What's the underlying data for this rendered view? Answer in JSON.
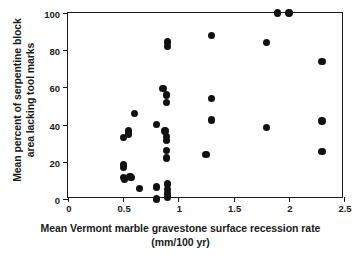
{
  "chart_data": {
    "type": "scatter",
    "title": "",
    "xlabel": "Mean Vermont marble gravestone surface recession rate (mm/100 yr)",
    "xlabel_line1": "Mean Vermont marble gravestone surface recession rate",
    "xlabel_line2": "(mm/100 yr)",
    "ylabel": "Mean percent of serpentine block area lacking tool marks",
    "ylabel_line1": "Mean percent of serpentine block",
    "ylabel_line2": "area lacking tool marks",
    "xlim": [
      0,
      2.5
    ],
    "ylim": [
      0,
      100
    ],
    "xticks": [
      0,
      0.5,
      1,
      1.5,
      2,
      2.5
    ],
    "xticklabels": [
      "0",
      "0.5",
      "1",
      "1.5",
      "2",
      "2.5"
    ],
    "yticks": [
      0,
      20,
      40,
      60,
      80,
      100
    ],
    "yticklabels": [
      "0",
      "20",
      "40",
      "60",
      "80",
      "100"
    ],
    "grid": false,
    "legend": null,
    "marker": "filled-circle",
    "marker_color": "#111111",
    "points": [
      {
        "x": 0.5,
        "y": 33.0
      },
      {
        "x": 0.5,
        "y": 18.5
      },
      {
        "x": 0.5,
        "y": 17.0
      },
      {
        "x": 0.5,
        "y": 11.5
      },
      {
        "x": 0.51,
        "y": 10.5
      },
      {
        "x": 0.55,
        "y": 36.5
      },
      {
        "x": 0.55,
        "y": 35.0
      },
      {
        "x": 0.56,
        "y": 12.0
      },
      {
        "x": 0.57,
        "y": 11.5
      },
      {
        "x": 0.6,
        "y": 46.0
      },
      {
        "x": 0.65,
        "y": 5.5
      },
      {
        "x": 0.8,
        "y": 40.0
      },
      {
        "x": 0.8,
        "y": 6.5
      },
      {
        "x": 0.8,
        "y": 0.0
      },
      {
        "x": 0.86,
        "y": 59.5
      },
      {
        "x": 0.89,
        "y": 56.0
      },
      {
        "x": 0.89,
        "y": 52.0
      },
      {
        "x": 0.88,
        "y": 36.5
      },
      {
        "x": 0.89,
        "y": 33.5
      },
      {
        "x": 0.89,
        "y": 31.5
      },
      {
        "x": 0.89,
        "y": 26.0
      },
      {
        "x": 0.89,
        "y": 22.0
      },
      {
        "x": 0.9,
        "y": 84.5
      },
      {
        "x": 0.9,
        "y": 82.0
      },
      {
        "x": 0.9,
        "y": 8.0
      },
      {
        "x": 0.9,
        "y": 5.0
      },
      {
        "x": 0.9,
        "y": 3.0
      },
      {
        "x": 0.9,
        "y": 1.0
      },
      {
        "x": 1.25,
        "y": 24.0
      },
      {
        "x": 1.3,
        "y": 88.0
      },
      {
        "x": 1.3,
        "y": 54.0
      },
      {
        "x": 1.3,
        "y": 42.5
      },
      {
        "x": 1.8,
        "y": 84.0
      },
      {
        "x": 1.8,
        "y": 38.5
      },
      {
        "x": 1.9,
        "y": 100.0
      },
      {
        "x": 2.0,
        "y": 100.0
      },
      {
        "x": 2.3,
        "y": 74.0
      },
      {
        "x": 2.3,
        "y": 42.0
      },
      {
        "x": 2.3,
        "y": 25.5
      }
    ]
  }
}
